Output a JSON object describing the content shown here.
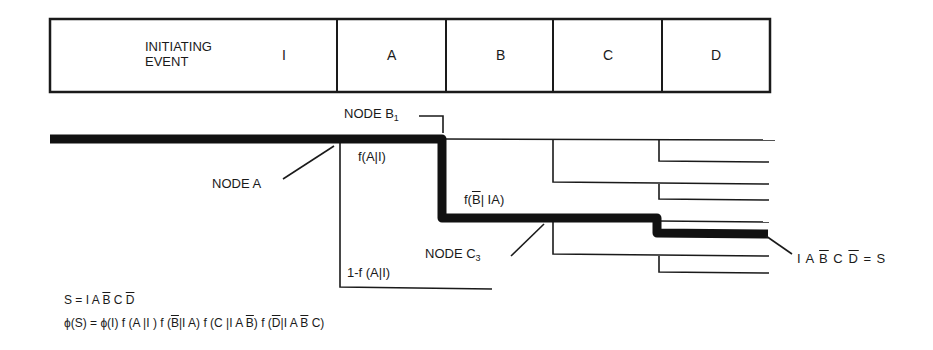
{
  "header": {
    "columns": [
      {
        "label_line1": "INITIATING",
        "label_line2": "EVENT",
        "symbol": "I"
      },
      {
        "symbol": "A"
      },
      {
        "symbol": "B"
      },
      {
        "symbol": "C"
      },
      {
        "symbol": "D"
      }
    ]
  },
  "nodes": {
    "node_a": "NODE A",
    "node_b1": "NODE B",
    "node_b1_sub": "1",
    "node_c3": "NODE C",
    "node_c3_sub": "3"
  },
  "branch_labels": {
    "f_a_given_i": "f(A|I)",
    "one_minus_f_a_given_i": "1-f (A|I)",
    "f_bbar_prefix": "f(",
    "f_bbar_bar": "B",
    "f_bbar_suffix": "| IA)"
  },
  "sequence_label": {
    "p1": "I A ",
    "bbar": "B",
    "p2": " C ",
    "dbar": "D",
    "p3": " = S"
  },
  "equations": {
    "s_def": {
      "p1": "S = I A ",
      "bbar": "B",
      "p2": " C ",
      "dbar": "D"
    },
    "phi": {
      "p1": "ϕ(S) = ϕ(I) f (A |I ) f (",
      "bbar1": "B",
      "p2": "|I A) f (C |I A ",
      "bbar2": "B",
      "p3": ") f (",
      "dbar": "D",
      "p4": "|I A ",
      "bbar3": "B",
      "p5": " C)"
    }
  },
  "colors": {
    "line": "#1a1a1a",
    "background": "#ffffff"
  }
}
